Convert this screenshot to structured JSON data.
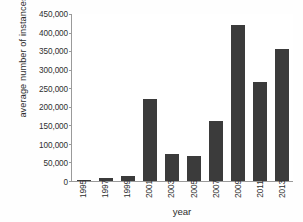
{
  "chart_data": {
    "type": "bar",
    "title": "",
    "xlabel": "year",
    "ylabel": "average number of instances",
    "categories": [
      "1995",
      "1997",
      "1999",
      "2001",
      "2003",
      "2005",
      "2007",
      "2009",
      "2011",
      "2013"
    ],
    "values": [
      2000,
      8000,
      13000,
      220000,
      73000,
      68000,
      161000,
      421000,
      266000,
      357000
    ],
    "ylim": [
      0,
      450000
    ],
    "ytick_values": [
      0,
      50000,
      100000,
      150000,
      200000,
      250000,
      300000,
      350000,
      400000,
      450000
    ],
    "ytick_labels": [
      "0",
      "50,000",
      "100,000",
      "150,000",
      "200,000",
      "250,000",
      "300,000",
      "350,000",
      "400,000",
      "450,000"
    ],
    "grid": false,
    "legend": null,
    "bar_color": "#3b3b3b",
    "axis_color": "#9a9a9a",
    "background_color": "#ffffff"
  }
}
